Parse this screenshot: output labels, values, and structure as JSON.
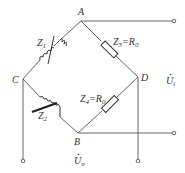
{
  "diagram": {
    "type": "AC bridge circuit",
    "nodes": {
      "A": {
        "label": "A"
      },
      "B": {
        "label": "B"
      },
      "C": {
        "label": "C"
      },
      "D": {
        "label": "D"
      }
    },
    "components": [
      {
        "id": "Z1",
        "label": "Z",
        "sub": "1",
        "kind": "variable inductor",
        "between": [
          "A",
          "C"
        ]
      },
      {
        "id": "Z2",
        "label": "Z",
        "sub": "2",
        "kind": "variable inductor",
        "between": [
          "C",
          "B"
        ]
      },
      {
        "id": "Z3",
        "label": "Z",
        "sub": "3",
        "eq": "=R",
        "eq_sub": "0",
        "kind": "resistor",
        "between": [
          "A",
          "D"
        ]
      },
      {
        "id": "Z4",
        "label": "Z",
        "sub": "4",
        "eq": "=R",
        "eq_sub": "0",
        "kind": "resistor",
        "between": [
          "D",
          "B"
        ]
      }
    ],
    "input": {
      "label": "U",
      "dot": "˙",
      "sub": "i",
      "terminals": [
        "A",
        "B"
      ]
    },
    "output": {
      "label": "U",
      "dot": "˙",
      "sub": "o",
      "terminals": [
        "C",
        "D"
      ]
    }
  }
}
